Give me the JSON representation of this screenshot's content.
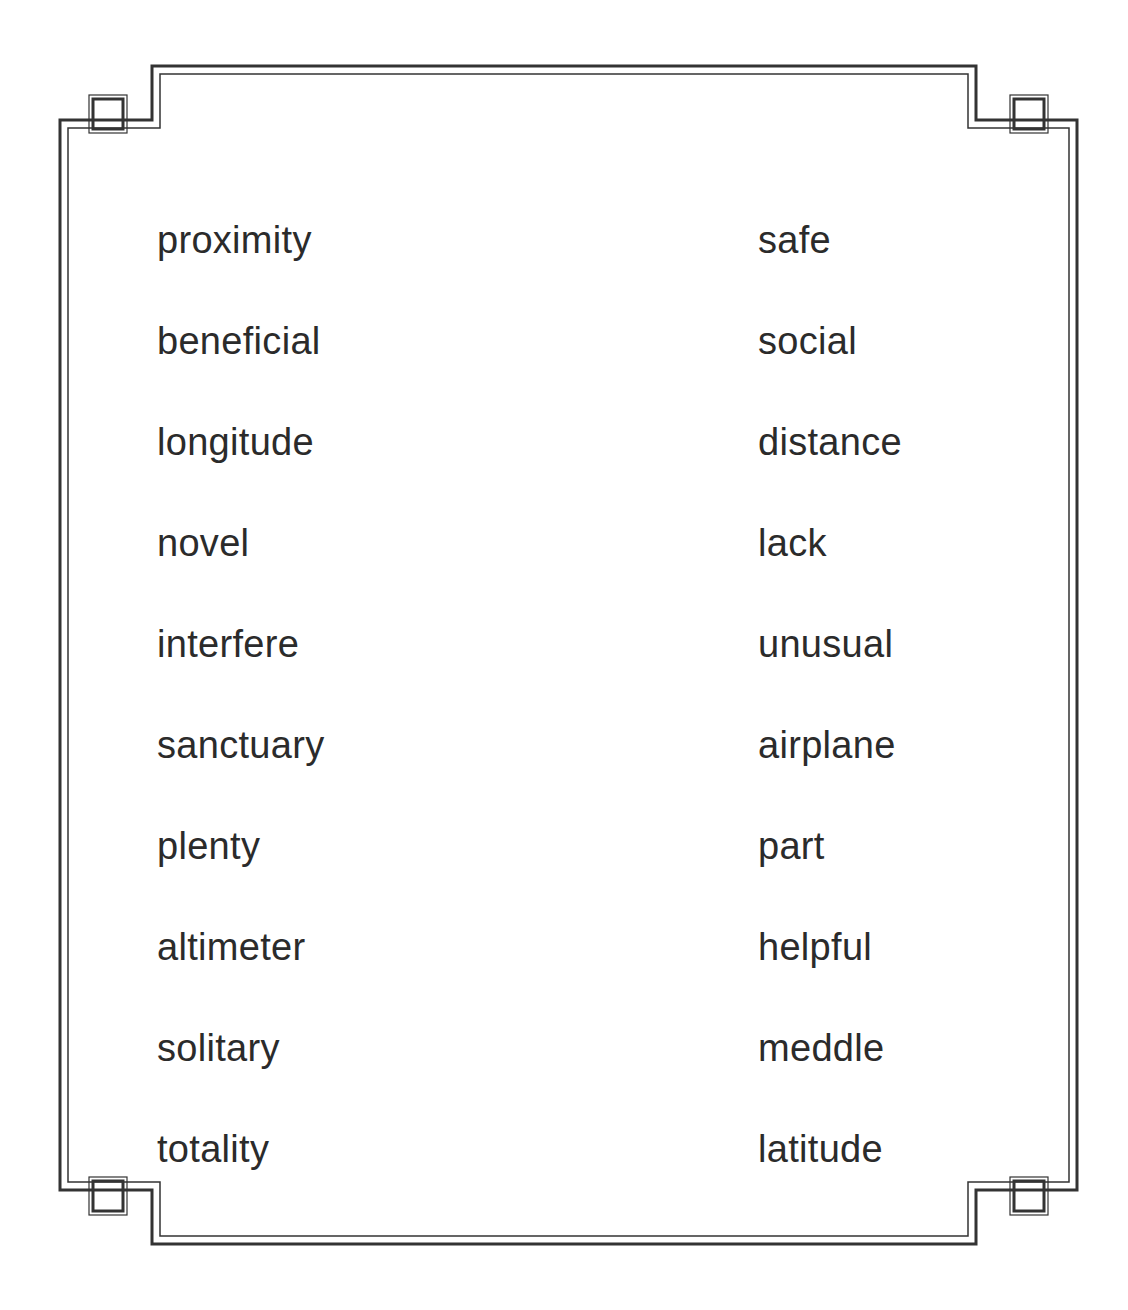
{
  "page": {
    "type": "vocabulary-word-list-worksheet",
    "background_color": "#ffffff",
    "text_color": "#2b2b2b",
    "frame_color": "#333333"
  },
  "frame": {
    "style": "double-line-stepped-corner-border",
    "corner_ornament": "small-square",
    "corners": [
      "top-left",
      "top-right",
      "bottom-left",
      "bottom-right"
    ]
  },
  "columns": {
    "left": {
      "name": "left-word-column",
      "words": [
        "proximity",
        "beneficial",
        "longitude",
        "novel",
        "interfere",
        "sanctuary",
        "plenty",
        "altimeter",
        "solitary",
        "totality"
      ]
    },
    "right": {
      "name": "right-word-column",
      "words": [
        "safe",
        "social",
        "distance",
        "lack",
        "unusual",
        "airplane",
        "part",
        "helpful",
        "meddle",
        "latitude"
      ]
    }
  }
}
